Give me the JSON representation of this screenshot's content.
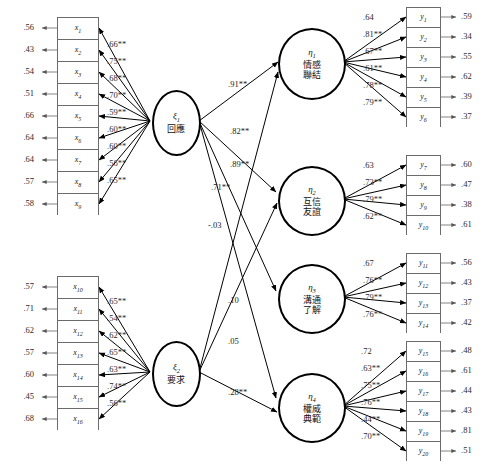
{
  "diagram": {
    "type": "structural-equation-model-path-diagram",
    "significance_marker": "**",
    "exogenous": [
      {
        "id": "xi1",
        "symbol": "ξ",
        "subscript": "1",
        "label": "回應",
        "indicators": [
          {
            "name": "x",
            "sub": "1",
            "residual": ".56",
            "loading": ".66**"
          },
          {
            "name": "x",
            "sub": "2",
            "residual": ".43",
            "loading": ".75**"
          },
          {
            "name": "x",
            "sub": "3",
            "residual": ".54",
            "loading": ".68**"
          },
          {
            "name": "x",
            "sub": "4",
            "residual": ".51",
            "loading": ".70**"
          },
          {
            "name": "x",
            "sub": "5",
            "residual": ".66",
            "loading": ".59**"
          },
          {
            "name": "x",
            "sub": "6",
            "residual": ".64",
            "loading": ".60**"
          },
          {
            "name": "x",
            "sub": "7",
            "residual": ".64",
            "loading": ".60**"
          },
          {
            "name": "x",
            "sub": "8",
            "residual": ".57",
            "loading": ".56**"
          },
          {
            "name": "x",
            "sub": "9",
            "residual": ".58",
            "loading": ".65**"
          }
        ]
      },
      {
        "id": "xi2",
        "symbol": "ξ",
        "subscript": "2",
        "label": "要求",
        "indicators": [
          {
            "name": "x",
            "sub": "10",
            "residual": ".57",
            "loading": ".65**"
          },
          {
            "name": "x",
            "sub": "11",
            "residual": ".71",
            "loading": ".54**"
          },
          {
            "name": "x",
            "sub": "12",
            "residual": ".62",
            "loading": ".62**"
          },
          {
            "name": "x",
            "sub": "13",
            "residual": ".57",
            "loading": ".65**"
          },
          {
            "name": "x",
            "sub": "14",
            "residual": ".60",
            "loading": ".63**"
          },
          {
            "name": "x",
            "sub": "15",
            "residual": ".45",
            "loading": ".74**"
          },
          {
            "name": "x",
            "sub": "16",
            "residual": ".68",
            "loading": ".56**"
          }
        ]
      }
    ],
    "endogenous": [
      {
        "id": "eta1",
        "symbol": "η",
        "subscript": "1",
        "label_line1": "情感",
        "label_line2": "聯結",
        "indicators": [
          {
            "name": "y",
            "sub": "1",
            "loading": ".64",
            "residual": ".59"
          },
          {
            "name": "y",
            "sub": "2",
            "loading": ".81**",
            "residual": ".34"
          },
          {
            "name": "y",
            "sub": "3",
            "loading": ".67**",
            "residual": ".55"
          },
          {
            "name": "y",
            "sub": "4",
            "loading": ".61**",
            "residual": ".62"
          },
          {
            "name": "y",
            "sub": "5",
            "loading": ".78**",
            "residual": ".39"
          },
          {
            "name": "y",
            "sub": "6",
            "loading": ".79**",
            "residual": ".37"
          }
        ]
      },
      {
        "id": "eta2",
        "symbol": "η",
        "subscript": "2",
        "label_line1": "互信",
        "label_line2": "友誼",
        "indicators": [
          {
            "name": "y",
            "sub": "7",
            "loading": ".63",
            "residual": ".60"
          },
          {
            "name": "y",
            "sub": "8",
            "loading": ".73**",
            "residual": ".47"
          },
          {
            "name": "y",
            "sub": "9",
            "loading": ".79**",
            "residual": ".38"
          },
          {
            "name": "y",
            "sub": "10",
            "loading": ".62**",
            "residual": ".61"
          }
        ]
      },
      {
        "id": "eta3",
        "symbol": "η",
        "subscript": "3",
        "label_line1": "溝通",
        "label_line2": "了解",
        "indicators": [
          {
            "name": "y",
            "sub": "11",
            "loading": ".67",
            "residual": ".56"
          },
          {
            "name": "y",
            "sub": "12",
            "loading": ".76**",
            "residual": ".43"
          },
          {
            "name": "y",
            "sub": "13",
            "loading": ".79**",
            "residual": ".37"
          },
          {
            "name": "y",
            "sub": "14",
            "loading": ".76**",
            "residual": ".42"
          }
        ]
      },
      {
        "id": "eta4",
        "symbol": "η",
        "subscript": "4",
        "label_line1": "權威",
        "label_line2": "典範",
        "indicators": [
          {
            "name": "y",
            "sub": "15",
            "loading": ".72",
            "residual": ".48"
          },
          {
            "name": "y",
            "sub": "16",
            "loading": ".63**",
            "residual": ".61"
          },
          {
            "name": "y",
            "sub": "17",
            "loading": ".75**",
            "residual": ".44"
          },
          {
            "name": "y",
            "sub": "18",
            "loading": ".76**",
            "residual": ".43"
          },
          {
            "name": "y",
            "sub": "19",
            "loading": ".44**",
            "residual": ".81"
          },
          {
            "name": "y",
            "sub": "20",
            "loading": ".70**",
            "residual": ".51"
          }
        ]
      }
    ],
    "structural_paths": [
      {
        "from": "xi1",
        "to": "eta1",
        "coefficient": ".91**"
      },
      {
        "from": "xi1",
        "to": "eta2",
        "coefficient": ".82**"
      },
      {
        "from": "xi1",
        "to": "eta3",
        "coefficient": ".89**"
      },
      {
        "from": "xi1",
        "to": "eta4",
        "coefficient": ".71**"
      },
      {
        "from": "xi1",
        "to": "eta4b",
        "coefficient": "-.03"
      },
      {
        "from": "xi2",
        "to": "eta1",
        "coefficient": ".10"
      },
      {
        "from": "xi2",
        "to": "eta2",
        "coefficient": ".05"
      },
      {
        "from": "xi2",
        "to": "eta4",
        "coefficient": ".28**"
      }
    ]
  }
}
